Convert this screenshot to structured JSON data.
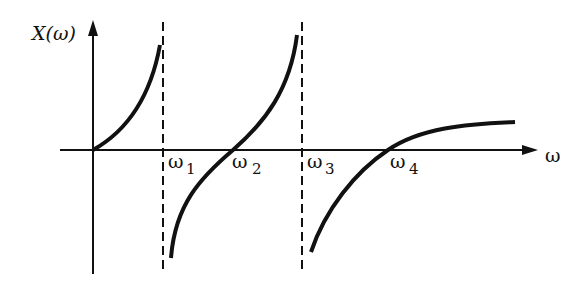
{
  "diagram": {
    "y_axis_label": "X(ω)",
    "x_axis_label": "ω",
    "markers": [
      {
        "name": "ω",
        "sub": "1",
        "type": "pole"
      },
      {
        "name": "ω",
        "sub": "2",
        "type": "zero"
      },
      {
        "name": "ω",
        "sub": "3",
        "type": "pole"
      },
      {
        "name": "ω",
        "sub": "4",
        "type": "zero"
      }
    ],
    "colors": {
      "ink": "#111111",
      "background": "#ffffff"
    }
  }
}
